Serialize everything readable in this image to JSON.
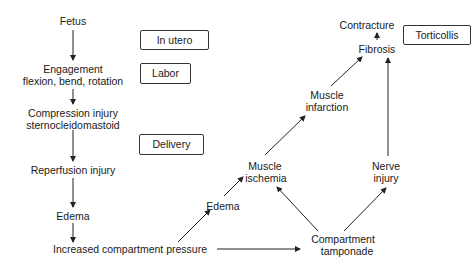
{
  "diagram": {
    "stage_labels": {
      "in_utero": "In utero",
      "labor": "Labor",
      "delivery": "Delivery",
      "torticollis": "Torticollis"
    },
    "left_chain": {
      "fetus": "Fetus",
      "engagement_1": "Engagement",
      "engagement_2": "flexion, bend, rotation",
      "compression_1": "Compression injury",
      "compression_2": "sternocleidomastoid",
      "reperfusion": "Reperfusion injury",
      "edema": "Edema",
      "pressure": "Increased compartment pressure"
    },
    "right_network": {
      "edema": "Edema",
      "ischemia_1": "Muscle",
      "ischemia_2": "ischemia",
      "infarction_1": "Muscle",
      "infarction_2": "infarction",
      "fibrosis": "Fibrosis",
      "contracture": "Contracture",
      "nerve_1": "Nerve",
      "nerve_2": "injury",
      "tamponade_1": "Compartment",
      "tamponade_2": "tamponade"
    },
    "colors": {
      "line": "#222222",
      "text": "#1a1a1a",
      "box_border": "#333333"
    }
  }
}
